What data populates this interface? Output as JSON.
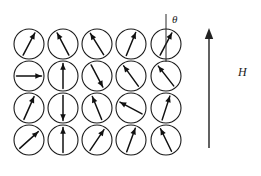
{
  "figure": {
    "name": "spin-lattice-in-external-field",
    "background_color": "#ffffff",
    "ink_color": "#111111",
    "width": 261,
    "height": 176
  },
  "lattice": {
    "rows": 4,
    "cols": 5,
    "circle_radius": 15,
    "col_x": [
      29,
      63,
      97,
      131,
      166
    ],
    "row_y": [
      44,
      76,
      108,
      140
    ],
    "spins": [
      [
        {
          "label": "spin-r1c1",
          "angle_deg": 62
        },
        {
          "label": "spin-r1c2",
          "angle_deg": 118
        },
        {
          "label": "spin-r1c3",
          "angle_deg": 122
        },
        {
          "label": "spin-r1c4",
          "angle_deg": 68
        },
        {
          "label": "spin-r1c5",
          "angle_deg": 62
        }
      ],
      [
        {
          "label": "spin-r2c1",
          "angle_deg": 0
        },
        {
          "label": "spin-r2c2",
          "angle_deg": 90
        },
        {
          "label": "spin-r2c3",
          "angle_deg": -62
        },
        {
          "label": "spin-r2c4",
          "angle_deg": 126
        },
        {
          "label": "spin-r2c5",
          "angle_deg": 128
        }
      ],
      [
        {
          "label": "spin-r3c1",
          "angle_deg": 66
        },
        {
          "label": "spin-r3c2",
          "angle_deg": -90
        },
        {
          "label": "spin-r3c3",
          "angle_deg": 112
        },
        {
          "label": "spin-r3c4",
          "angle_deg": 152
        },
        {
          "label": "spin-r3c5",
          "angle_deg": 72
        }
      ],
      [
        {
          "label": "spin-r4c1",
          "angle_deg": 42
        },
        {
          "label": "spin-r4c2",
          "angle_deg": 90
        },
        {
          "label": "spin-r4c3",
          "angle_deg": 56
        },
        {
          "label": "spin-r4c4",
          "angle_deg": 70
        },
        {
          "label": "spin-r4c5",
          "angle_deg": 116
        }
      ]
    ]
  },
  "annotation": {
    "theta_symbol": "θ",
    "reference_axis": {
      "name": "vertical-reference-axis",
      "x": 166,
      "y_top": 14,
      "y_bottom": 62
    },
    "theta_label_position": {
      "x": 172,
      "y": 14
    }
  },
  "field": {
    "symbol": "H",
    "label_position": {
      "x": 238,
      "y": 66
    },
    "arrow": {
      "x": 209,
      "y_tail": 148,
      "y_head": 28
    }
  }
}
